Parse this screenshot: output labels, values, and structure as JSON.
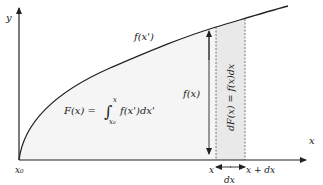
{
  "diagram": {
    "axes": {
      "y_label": "y",
      "x_label": "x"
    },
    "curve_label": "f(x')",
    "height_label": "f(x)",
    "area_formula": {
      "lhs": "F(x) =",
      "integral_symbol": "∫",
      "upper_limit": "x",
      "lower_limit": "x₀",
      "integrand": "f(x')dx'"
    },
    "strip_label": "dF(x) = f(x)dx",
    "x_ticks": {
      "origin": "x₀",
      "x": "x",
      "x_plus_dx": "x + dx"
    },
    "width_label": "dx",
    "colors": {
      "area_fill": "#f4f4f4",
      "strip_fill": "#e8e8e8",
      "stroke": "#222222"
    }
  }
}
